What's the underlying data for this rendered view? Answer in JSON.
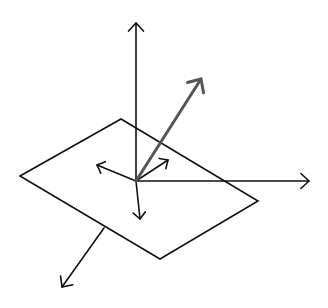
{
  "diagram": {
    "colors": {
      "background": "#ffffff",
      "line": "#111111",
      "highlight_vector": "#555555"
    },
    "origin": [
      136,
      181
    ],
    "plane": {
      "points": [
        [
          20,
          176
        ],
        [
          121,
          119
        ],
        [
          258,
          201
        ],
        [
          160,
          259
        ]
      ]
    },
    "axes": [
      {
        "name": "up-axis",
        "from": [
          136,
          181
        ],
        "to": [
          136,
          23
        ]
      },
      {
        "name": "right-axis",
        "from": [
          136,
          181
        ],
        "to": [
          309,
          181
        ]
      }
    ],
    "small_arrows": [
      {
        "name": "left-in-plane",
        "from": [
          136,
          181
        ],
        "to": [
          97,
          165
        ]
      },
      {
        "name": "upright-in-plane",
        "from": [
          136,
          181
        ],
        "to": [
          168,
          160
        ]
      },
      {
        "name": "down-short",
        "from": [
          136,
          181
        ],
        "to": [
          140,
          219
        ]
      }
    ],
    "normal_below": {
      "from": [
        104,
        228
      ],
      "to": [
        62,
        287
      ]
    },
    "highlight_vector": {
      "from": [
        136,
        181
      ],
      "to": [
        201,
        79
      ]
    }
  }
}
